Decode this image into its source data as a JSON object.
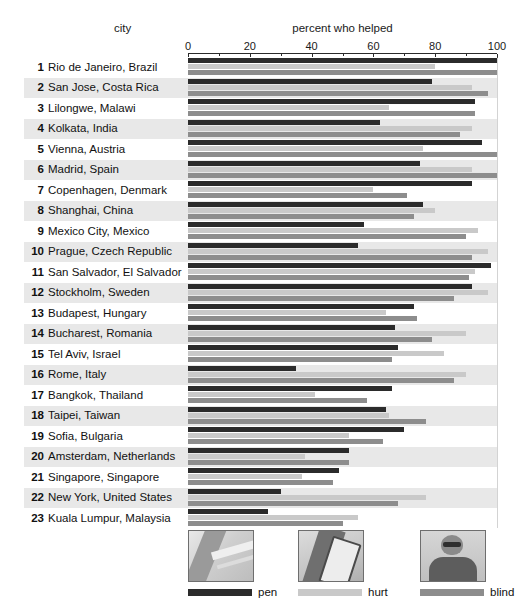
{
  "header": {
    "city_label": "city",
    "axis_title": "percent who helped"
  },
  "legend": {
    "items": [
      {
        "key": "pen",
        "label": "pen",
        "color": "#2b2b2b",
        "photo": "photo-dropped-pen"
      },
      {
        "key": "hurt",
        "label": "hurt",
        "color": "#c9c9c9",
        "photo": "photo-hurt-leg"
      },
      {
        "key": "blind",
        "label": "blind",
        "color": "#8d8d8d",
        "photo": "photo-blind-man"
      }
    ]
  },
  "chart_data": {
    "type": "bar",
    "orientation": "horizontal",
    "title": "percent who helped",
    "xlabel": "percent who helped",
    "ylabel": "city",
    "xlim": [
      0,
      100
    ],
    "xticks": [
      0,
      20,
      40,
      60,
      80,
      100
    ],
    "xtick_labels": [
      "0",
      "20",
      "40",
      "60",
      "80",
      "100"
    ],
    "minor_tick_step": 10,
    "grid": true,
    "legend_position": "bottom",
    "categories": [
      "Rio de Janeiro, Brazil",
      "San Jose, Costa Rica",
      "Lilongwe, Malawi",
      "Kolkata, India",
      "Vienna, Austria",
      "Madrid, Spain",
      "Copenhagen, Denmark",
      "Shanghai, China",
      "Mexico City, Mexico",
      "Prague, Czech Republic",
      "San Salvador, El Salvador",
      "Stockholm, Sweden",
      "Budapest, Hungary",
      "Bucharest, Romania",
      "Tel Aviv, Israel",
      "Rome, Italy",
      "Bangkok, Thailand",
      "Taipei, Taiwan",
      "Sofia, Bulgaria",
      "Amsterdam, Netherlands",
      "Singapore, Singapore",
      "New York, United States",
      "Kuala Lumpur, Malaysia"
    ],
    "ranks": [
      1,
      2,
      3,
      4,
      5,
      6,
      7,
      8,
      9,
      10,
      11,
      12,
      13,
      14,
      15,
      16,
      17,
      18,
      19,
      20,
      21,
      22,
      23
    ],
    "series": [
      {
        "name": "pen",
        "color": "#2b2b2b",
        "values": [
          100,
          79,
          93,
          62,
          95,
          75,
          92,
          76,
          57,
          55,
          98,
          92,
          73,
          67,
          68,
          35,
          66,
          64,
          70,
          52,
          49,
          30,
          26
        ]
      },
      {
        "name": "hurt",
        "color": "#c9c9c9",
        "values": [
          80,
          92,
          65,
          92,
          76,
          92,
          60,
          80,
          94,
          97,
          93,
          97,
          64,
          90,
          83,
          90,
          41,
          65,
          52,
          38,
          37,
          77,
          55
        ]
      },
      {
        "name": "blind",
        "color": "#8d8d8d",
        "values": [
          100,
          97,
          93,
          88,
          100,
          100,
          71,
          73,
          90,
          92,
          91,
          86,
          74,
          79,
          66,
          86,
          58,
          77,
          63,
          52,
          47,
          68,
          50
        ]
      }
    ]
  }
}
